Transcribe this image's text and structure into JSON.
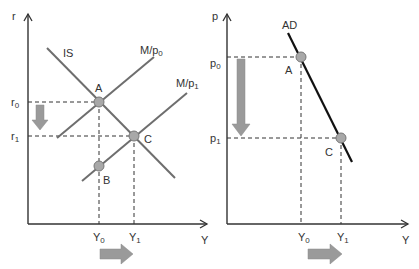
{
  "left_panel": {
    "y_axis_label": "r",
    "x_axis_label": "Y",
    "curves": [
      {
        "name": "IS",
        "label": "IS"
      },
      {
        "name": "M/p0",
        "label_main": "M/p",
        "label_sub": "0"
      },
      {
        "name": "M/p1",
        "label_main": "M/p",
        "label_sub": "1"
      }
    ],
    "points": [
      {
        "label": "A"
      },
      {
        "label": "B"
      },
      {
        "label": "C"
      }
    ],
    "ticks": {
      "r0": {
        "main": "r",
        "sub": "0"
      },
      "r1": {
        "main": "r",
        "sub": "1"
      },
      "Y0": {
        "main": "Y",
        "sub": "0"
      },
      "Y1": {
        "main": "Y",
        "sub": "1"
      }
    }
  },
  "right_panel": {
    "y_axis_label": "p",
    "x_axis_label": "Y",
    "curve_label": "AD",
    "points": [
      {
        "label": "A"
      },
      {
        "label": "C"
      }
    ],
    "ticks": {
      "p0": {
        "main": "p",
        "sub": "0"
      },
      "p1": {
        "main": "p",
        "sub": "1"
      },
      "Y0": {
        "main": "Y",
        "sub": "0"
      },
      "Y1": {
        "main": "Y",
        "sub": "1"
      }
    }
  },
  "colors": {
    "curve_gray": "#6e6e6e",
    "ad_line": "#111111",
    "point_fill": "#a8a8a8",
    "arrow_fill": "#9a9a9a",
    "axis": "#333333"
  }
}
